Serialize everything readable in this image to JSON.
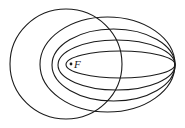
{
  "diagram": {
    "focus": {
      "label": "F",
      "x": 71,
      "y": 64
    },
    "stroke_color": "#1a1a1a",
    "curves": [
      {
        "name": "circle",
        "cx": 66,
        "cy": 64,
        "rx": 56,
        "ry": 55
      },
      {
        "name": "ellipse-2",
        "cx": 107.5,
        "cy": 64.5,
        "rx": 67.5,
        "ry": 47.5
      },
      {
        "name": "ellipse-3",
        "cx": 113.5,
        "cy": 65,
        "rx": 61.5,
        "ry": 36
      },
      {
        "name": "ellipse-4",
        "cx": 116.5,
        "cy": 65,
        "rx": 58.5,
        "ry": 25
      },
      {
        "name": "ellipse-5",
        "cx": 120.5,
        "cy": 64.5,
        "rx": 54.5,
        "ry": 13.5
      }
    ]
  }
}
